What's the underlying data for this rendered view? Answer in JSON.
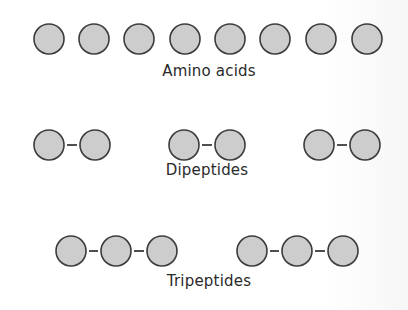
{
  "diagram": {
    "style": {
      "circle_fill": "#cdcdcd",
      "circle_stroke": "#3c3c3c",
      "bond_color": "#3c3c3c",
      "circle_radius": 15
    },
    "groups": [
      {
        "name": "amino-acids",
        "label": "Amino acids",
        "label_x": 209,
        "label_y": 72,
        "cy": 39,
        "molecules": [
          {
            "cx": [
              49
            ]
          },
          {
            "cx": [
              94
            ]
          },
          {
            "cx": [
              139
            ]
          },
          {
            "cx": [
              185
            ]
          },
          {
            "cx": [
              230
            ]
          },
          {
            "cx": [
              275
            ]
          },
          {
            "cx": [
              321
            ]
          },
          {
            "cx": [
              367
            ]
          }
        ]
      },
      {
        "name": "dipeptides",
        "label": "Dipeptides",
        "label_x": 207,
        "label_y": 171,
        "cy": 145,
        "molecules": [
          {
            "cx": [
              49,
              95
            ]
          },
          {
            "cx": [
              184,
              230
            ]
          },
          {
            "cx": [
              319,
              365
            ]
          }
        ]
      },
      {
        "name": "tripeptides",
        "label": "Tripeptides",
        "label_x": 209,
        "label_y": 282,
        "cy": 251,
        "molecules": [
          {
            "cx": [
              71,
              116,
              162
            ]
          },
          {
            "cx": [
              252,
              297,
              343
            ]
          }
        ]
      }
    ]
  }
}
